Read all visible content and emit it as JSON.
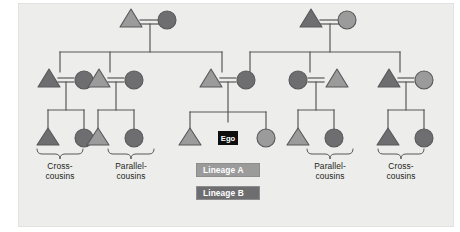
{
  "figure": {
    "type": "kinship-diagram",
    "background": "#ededeb",
    "page_background": "#ffffff",
    "line_color": "#58585b",
    "generations": 3
  },
  "colors": {
    "lineage_a": "#9b9b9b",
    "lineage_b": "#6e6e70",
    "symbol_stroke": "#58585b",
    "line": "#58585b",
    "ego_fill": "#0f0f0f",
    "ego_text": "#ffffff",
    "legend_a_fill": "#9b9b9b",
    "legend_b_fill": "#6e6e70",
    "legend_text": "#ffffff",
    "label_text": "#231f20"
  },
  "ego": {
    "label": "Ego",
    "shape": "square",
    "fill": "#0f0f0f"
  },
  "legend": {
    "items": [
      {
        "label": "Lineage A",
        "fill": "#9b9b9b",
        "swatch_name": "lineage-a-swatch"
      },
      {
        "label": "Lineage B",
        "fill": "#6e6e70",
        "swatch_name": "lineage-b-swatch"
      }
    ]
  },
  "bracket_labels": [
    {
      "line1": "Cross-",
      "line2": "cousins",
      "position": "far-left",
      "x": 60
    },
    {
      "line1": "Parallel-",
      "line2": "cousins",
      "position": "left",
      "x": 131
    },
    {
      "line1": "Parallel-",
      "line2": "cousins",
      "position": "right",
      "x": 330
    },
    {
      "line1": "Cross-",
      "line2": "cousins",
      "position": "far-right",
      "x": 401
    }
  ],
  "generation_1": {
    "name": "grandparents",
    "couples": [
      {
        "id": "g1-left",
        "members": [
          {
            "sex": "male",
            "shape": "triangle",
            "lineage": "A",
            "fill": "#9b9b9b"
          },
          {
            "sex": "female",
            "shape": "circle",
            "lineage": "B",
            "fill": "#6e6e70"
          }
        ]
      },
      {
        "id": "g1-right",
        "members": [
          {
            "sex": "male",
            "shape": "triangle",
            "lineage": "B",
            "fill": "#6e6e70"
          },
          {
            "sex": "female",
            "shape": "circle",
            "lineage": "A",
            "fill": "#9b9b9b"
          }
        ]
      }
    ]
  },
  "generation_2": {
    "name": "parents-aunts-uncles",
    "couples": [
      {
        "id": "g2-1",
        "members": [
          {
            "sex": "male",
            "shape": "triangle",
            "lineage": "B",
            "fill": "#6e6e70"
          },
          {
            "sex": "female",
            "shape": "circle",
            "lineage": "B",
            "fill": "#6e6e70",
            "descent": true
          }
        ]
      },
      {
        "id": "g2-2",
        "members": [
          {
            "sex": "male",
            "shape": "triangle",
            "lineage": "A",
            "fill": "#9b9b9b",
            "descent": true
          },
          {
            "sex": "female",
            "shape": "circle",
            "lineage": "B",
            "fill": "#6e6e70"
          }
        ]
      },
      {
        "id": "g2-3-ego-parents",
        "members": [
          {
            "sex": "male",
            "shape": "triangle",
            "lineage": "A",
            "fill": "#9b9b9b",
            "descent": true
          },
          {
            "sex": "female",
            "shape": "circle",
            "lineage": "B",
            "fill": "#6e6e70",
            "descent": true
          }
        ]
      },
      {
        "id": "g2-4",
        "members": [
          {
            "sex": "female",
            "shape": "circle",
            "lineage": "B",
            "fill": "#6e6e70",
            "descent": true
          },
          {
            "sex": "male",
            "shape": "triangle",
            "lineage": "A",
            "fill": "#9b9b9b"
          }
        ]
      },
      {
        "id": "g2-5",
        "members": [
          {
            "sex": "male",
            "shape": "triangle",
            "lineage": "B",
            "fill": "#6e6e70",
            "descent": true
          },
          {
            "sex": "female",
            "shape": "circle",
            "lineage": "A",
            "fill": "#9b9b9b"
          }
        ]
      }
    ]
  },
  "generation_3": {
    "name": "ego-and-cousins",
    "sibling_sets": [
      {
        "id": "g3-cross-left",
        "relation": "Cross-cousins",
        "members": [
          {
            "sex": "male",
            "shape": "triangle",
            "lineage": "B",
            "fill": "#6e6e70"
          },
          {
            "sex": "female",
            "shape": "circle",
            "lineage": "B",
            "fill": "#6e6e70"
          }
        ]
      },
      {
        "id": "g3-parallel-left",
        "relation": "Parallel-cousins",
        "members": [
          {
            "sex": "male",
            "shape": "triangle",
            "lineage": "A",
            "fill": "#9b9b9b"
          },
          {
            "sex": "female",
            "shape": "circle",
            "lineage": "B",
            "fill": "#6e6e70"
          }
        ]
      },
      {
        "id": "g3-ego-siblings",
        "relation": "Ego and siblings",
        "members": [
          {
            "sex": "male",
            "shape": "triangle",
            "lineage": "A",
            "fill": "#9b9b9b"
          },
          {
            "sex": "ego",
            "shape": "square",
            "lineage": "ego",
            "fill": "#0f0f0f",
            "label": "Ego"
          },
          {
            "sex": "female",
            "shape": "circle",
            "lineage": "A",
            "fill": "#9b9b9b"
          }
        ]
      },
      {
        "id": "g3-parallel-right",
        "relation": "Parallel-cousins",
        "members": [
          {
            "sex": "male",
            "shape": "triangle",
            "lineage": "A",
            "fill": "#9b9b9b"
          },
          {
            "sex": "female",
            "shape": "circle",
            "lineage": "B",
            "fill": "#6e6e70"
          }
        ]
      },
      {
        "id": "g3-cross-right",
        "relation": "Cross-cousins",
        "members": [
          {
            "sex": "male",
            "shape": "triangle",
            "lineage": "B",
            "fill": "#6e6e70"
          },
          {
            "sex": "female",
            "shape": "circle",
            "lineage": "B",
            "fill": "#6e6e70"
          }
        ]
      }
    ]
  }
}
